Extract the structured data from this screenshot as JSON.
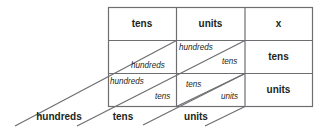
{
  "diagram": {
    "header_row": [
      "tens",
      "units",
      "x"
    ],
    "right_column": [
      "tens",
      "units"
    ],
    "cells": [
      {
        "row": 0,
        "col": 0,
        "upper": "",
        "lower": "hundreds"
      },
      {
        "row": 0,
        "col": 1,
        "upper": "hundreds",
        "lower": "tens"
      },
      {
        "row": 1,
        "col": 0,
        "upper": "hundreds",
        "lower": "tens"
      },
      {
        "row": 1,
        "col": 1,
        "upper": "tens",
        "lower": "units"
      }
    ],
    "bottom_labels": [
      "hundreds",
      "tens",
      "units"
    ],
    "colors": {
      "line": "#6d6e71",
      "text": "#231f20"
    }
  }
}
